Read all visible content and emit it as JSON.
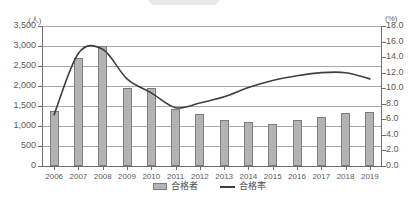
{
  "chart_data": {
    "type": "bar",
    "title": "",
    "subtitle": "",
    "xlabel": "",
    "categories": [
      "2006",
      "2007",
      "2008",
      "2009",
      "2010",
      "2011",
      "2012",
      "2013",
      "2014",
      "2015",
      "2016",
      "2017",
      "2018",
      "2019"
    ],
    "grid": true,
    "legend_position": "bottom-center",
    "axes": {
      "left": {
        "unit": "(人)",
        "ylabel": "合格者",
        "ylim": [
          0,
          3500
        ],
        "tick_step": 500,
        "ticks": [
          "0",
          "500",
          "1,000",
          "1,500",
          "2,000",
          "2,500",
          "3,000",
          "3,500"
        ],
        "tick_values": [
          0,
          500,
          1000,
          1500,
          2000,
          2500,
          3000,
          3500
        ]
      },
      "right": {
        "unit": "(%)",
        "ylabel": "合格率",
        "ylim": [
          0,
          18
        ],
        "tick_step": 2,
        "ticks": [
          "0.0",
          "2.0",
          "4.0",
          "6.0",
          "8.0",
          "10.0",
          "12.0",
          "14.0",
          "16.0",
          "18.0"
        ],
        "tick_values": [
          0,
          2,
          4,
          6,
          8,
          10,
          12,
          14,
          16,
          18
        ]
      }
    },
    "series": [
      {
        "name": "合格者",
        "kind": "bar",
        "axis": "left",
        "color": "#b3b3b3",
        "edge_color": "#7d7d7d",
        "values": [
          1380,
          2700,
          3000,
          1960,
          1950,
          1420,
          1300,
          1160,
          1100,
          1040,
          1140,
          1230,
          1320,
          1350
        ]
      },
      {
        "name": "合格率",
        "kind": "line",
        "axis": "right",
        "color": "#3f3f3f",
        "values": [
          6.6,
          14.5,
          15.0,
          11.2,
          9.4,
          7.5,
          8.1,
          8.9,
          10.1,
          11.0,
          11.6,
          12.0,
          12.0,
          11.2
        ]
      }
    ]
  },
  "legend": {
    "items": [
      {
        "label": "合格者",
        "marker": "bar-swatch"
      },
      {
        "label": "合格率",
        "marker": "line-swatch"
      }
    ]
  },
  "decor": {
    "top_pill": "rounded-pill-shape"
  }
}
